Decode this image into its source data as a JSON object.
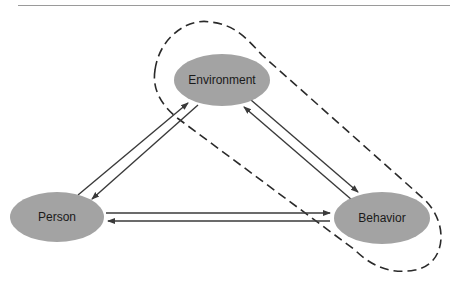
{
  "diagram": {
    "type": "triadic-reciprocal-causation",
    "nodes": [
      {
        "id": "environment",
        "label": "Environment"
      },
      {
        "id": "person",
        "label": "Person"
      },
      {
        "id": "behavior",
        "label": "Behavior"
      }
    ],
    "edges": [
      {
        "from": "person",
        "to": "environment",
        "direction": "bidirectional"
      },
      {
        "from": "environment",
        "to": "behavior",
        "direction": "bidirectional"
      },
      {
        "from": "person",
        "to": "behavior",
        "direction": "bidirectional"
      }
    ],
    "grouping": {
      "style": "dashed",
      "encloses": [
        "environment",
        "behavior"
      ]
    },
    "colors": {
      "node_fill": "#a3a3a3",
      "arrow": "#3a3a3a",
      "dashed_outline": "#2a2a2a",
      "rule": "#9a9a9a"
    }
  }
}
